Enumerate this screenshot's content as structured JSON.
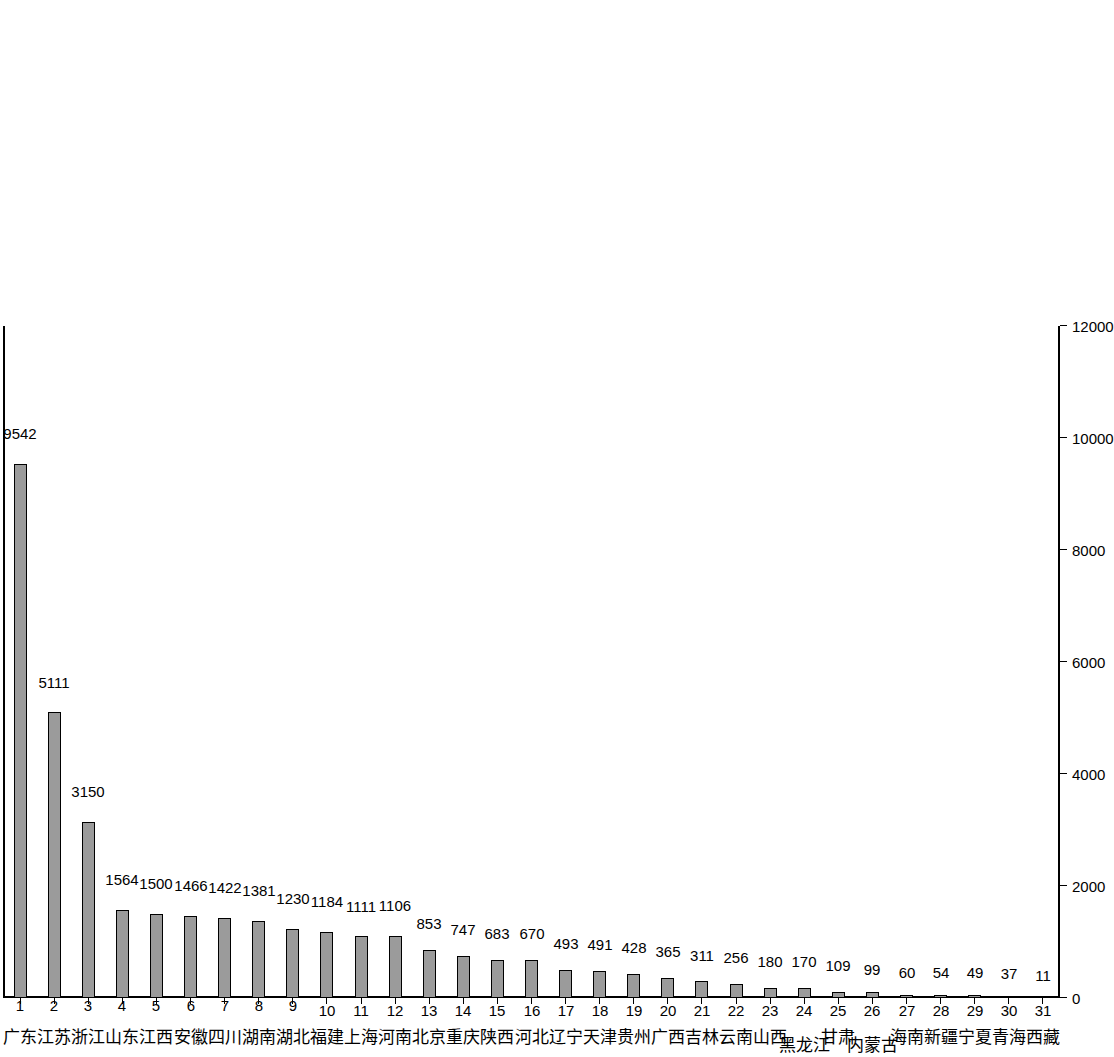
{
  "chart_data": {
    "type": "bar",
    "title": "",
    "subtitle": "",
    "xlabel": "",
    "ylabel": "",
    "orientation": "vertical-bars-rotated-page",
    "grid": false,
    "legend": null,
    "ylim": [
      0,
      12000
    ],
    "yticks": [
      0,
      2000,
      4000,
      6000,
      8000,
      10000,
      12000
    ],
    "ytick_labels": [
      "0",
      "2000",
      "4000",
      "6000",
      "8000",
      "10000",
      "12000"
    ],
    "value_axis_side": "right",
    "bar_fill": "#9b9b9b",
    "bar_edge": "#000000",
    "ranks": [
      "1",
      "2",
      "3",
      "4",
      "5",
      "6",
      "7",
      "8",
      "9",
      "10",
      "11",
      "12",
      "13",
      "14",
      "15",
      "16",
      "17",
      "18",
      "19",
      "20",
      "21",
      "22",
      "23",
      "24",
      "25",
      "26",
      "27",
      "28",
      "29",
      "30",
      "31"
    ],
    "categories": [
      "广东",
      "江苏",
      "浙江",
      "山东",
      "江西",
      "安徽",
      "四川",
      "湖南",
      "湖北",
      "福建",
      "上海",
      "河南",
      "北京",
      "重庆",
      "陕西",
      "河北",
      "辽宁",
      "天津",
      "贵州",
      "广西",
      "吉林",
      "云南",
      "山西",
      "黑龙江",
      "甘肃",
      "内蒙古",
      "海南",
      "新疆",
      "宁夏",
      "青海",
      "西藏"
    ],
    "values": [
      9542,
      5111,
      3150,
      1564,
      1500,
      1466,
      1422,
      1381,
      1230,
      1184,
      1111,
      1106,
      853,
      747,
      683,
      670,
      493,
      491,
      428,
      365,
      311,
      256,
      180,
      170,
      109,
      99,
      60,
      54,
      49,
      37,
      11
    ],
    "data_labels": [
      "9542",
      "5111",
      "3150",
      "1564",
      "1500",
      "1466",
      "1422",
      "1381",
      "1230",
      "1184",
      "1111",
      "1106",
      "853",
      "747",
      "683",
      "670",
      "493",
      "491",
      "428",
      "365",
      "311",
      "256",
      "180",
      "170",
      "109",
      "99",
      "60",
      "54",
      "49",
      "37",
      "11"
    ]
  }
}
